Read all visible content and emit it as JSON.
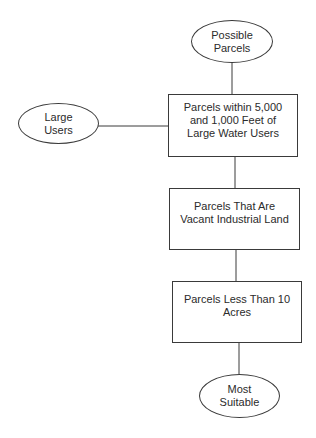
{
  "diagram": {
    "type": "flowchart",
    "colors": {
      "stroke": "#3a3a3a",
      "text": "#2b2b2b",
      "background": "#ffffff"
    },
    "nodes": {
      "possible_parcels": {
        "shape": "ellipse",
        "label": "Possible\nParcels"
      },
      "large_users": {
        "shape": "ellipse",
        "label": "Large\nUsers"
      },
      "within_distance": {
        "shape": "rectangle",
        "label": "Parcels within 5,000\nand 1,000 Feet of\nLarge Water Users"
      },
      "vacant_industrial": {
        "shape": "rectangle",
        "label": "Parcels That Are\nVacant Industrial Land"
      },
      "less_than_10_acres": {
        "shape": "rectangle",
        "label": "Parcels Less Than 10\nAcres"
      },
      "most_suitable": {
        "shape": "ellipse",
        "label": "Most\nSuitable"
      }
    },
    "edges": [
      {
        "from": "possible_parcels",
        "to": "within_distance"
      },
      {
        "from": "large_users",
        "to": "within_distance"
      },
      {
        "from": "within_distance",
        "to": "vacant_industrial"
      },
      {
        "from": "vacant_industrial",
        "to": "less_than_10_acres"
      },
      {
        "from": "less_than_10_acres",
        "to": "most_suitable"
      }
    ]
  }
}
